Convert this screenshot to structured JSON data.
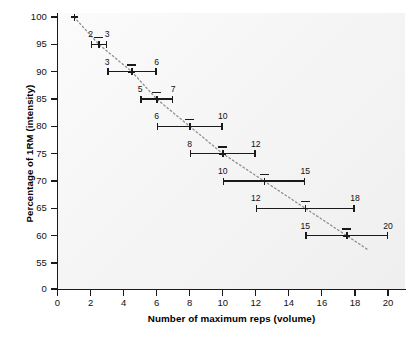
{
  "chart_data": {
    "type": "scatter",
    "title": "",
    "xlabel": "Number of maximum reps (volume)",
    "ylabel": "Percentage of 1RM (intensity)",
    "xlim": [
      0,
      21
    ],
    "ylim": [
      0,
      101
    ],
    "y_axis_break": true,
    "y_break_between": [
      0,
      55
    ],
    "grid": false,
    "legend": null,
    "xticks": [
      0,
      2,
      4,
      6,
      8,
      10,
      12,
      14,
      16,
      18,
      20
    ],
    "xtick_labels": [
      "0",
      "2",
      "4",
      "6",
      "8",
      "10",
      "12",
      "14",
      "16",
      "18",
      "20"
    ],
    "yticks": [
      0,
      55,
      60,
      65,
      70,
      75,
      80,
      85,
      90,
      95,
      100
    ],
    "ytick_labels": [
      "0",
      "55",
      "60",
      "65",
      "70",
      "75",
      "80",
      "85",
      "90",
      "95",
      "100"
    ],
    "marker": "plus",
    "trendline": "dotted",
    "points": [
      {
        "x": 1.0,
        "y": 100,
        "low": null,
        "high": null,
        "low_label": "",
        "high_label": "",
        "has_error_bar": false
      },
      {
        "x": 2.5,
        "y": 95,
        "low": 2,
        "high": 3,
        "low_label": "2",
        "high_label": "3",
        "has_error_bar": true
      },
      {
        "x": 4.5,
        "y": 90,
        "low": 3,
        "high": 6,
        "low_label": "3",
        "high_label": "6",
        "has_error_bar": true
      },
      {
        "x": 6.0,
        "y": 85,
        "low": 5,
        "high": 7,
        "low_label": "5",
        "high_label": "7",
        "has_error_bar": true
      },
      {
        "x": 8.0,
        "y": 80,
        "low": 6,
        "high": 10,
        "low_label": "6",
        "high_label": "10",
        "has_error_bar": true
      },
      {
        "x": 10.0,
        "y": 75,
        "low": 8,
        "high": 12,
        "low_label": "8",
        "high_label": "12",
        "has_error_bar": true
      },
      {
        "x": 12.5,
        "y": 70,
        "low": 10,
        "high": 15,
        "low_label": "10",
        "high_label": "15",
        "has_error_bar": true
      },
      {
        "x": 15.0,
        "y": 65,
        "low": 12,
        "high": 18,
        "low_label": "12",
        "high_label": "18",
        "has_error_bar": true
      },
      {
        "x": 17.5,
        "y": 60,
        "low": 15,
        "high": 20,
        "low_label": "15",
        "high_label": "20",
        "has_error_bar": true
      }
    ],
    "colors": {
      "ink": "#1a1a1a",
      "plot_background": "#f4f4f4",
      "page_background": "#ffffff",
      "trendline": "#8c8c8c"
    }
  },
  "caption": {
    "text": ""
  }
}
